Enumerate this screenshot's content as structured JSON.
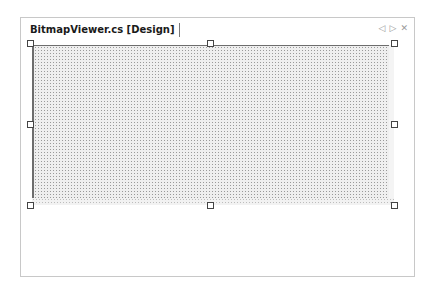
{
  "document_tab": {
    "title": "BitmapViewer.cs [Design]"
  },
  "tab_controls": {
    "scroll_left_icon": "◁",
    "scroll_right_icon": "▷",
    "close_icon": "✕"
  },
  "designer": {
    "selected_component": "form",
    "grid_visible": true
  }
}
